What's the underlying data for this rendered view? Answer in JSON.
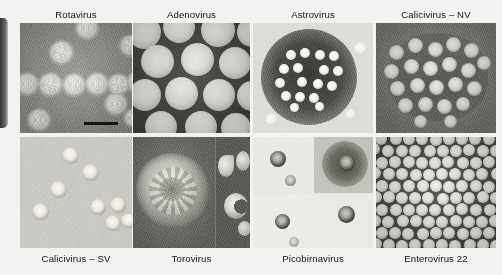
{
  "figure": {
    "kind": "electron-micrograph-panel-grid",
    "background_color": "#f2f2f0",
    "label_color": "#141414",
    "rows": 2,
    "columns": 4,
    "scale_bar": {
      "present": true,
      "panel": "Rotavirus",
      "label": ""
    },
    "edge_artifact": {
      "name": "dark-rounded-tab",
      "color": "#2c2c2c"
    }
  },
  "panels": [
    {
      "id": "rotavirus",
      "label": "Rotavirus",
      "label_position": "top",
      "row": 1,
      "col": 1,
      "stain_color": "#8e8e8a",
      "description": "wheel-like particles with spiky rim"
    },
    {
      "id": "adenovirus",
      "label": "Adenovirus",
      "label_position": "top",
      "row": 1,
      "col": 2,
      "stain_color": "#3f3f3c",
      "description": "large icosahedral particles on dark stain"
    },
    {
      "id": "astrovirus",
      "label": "Astrovirus",
      "label_position": "top",
      "row": 1,
      "col": 3,
      "stain_color": "#dddcd6",
      "description": "cluster of small particles in dark stain blob"
    },
    {
      "id": "calicivirus-nv",
      "label": "Calicivirus – NV",
      "label_position": "top",
      "row": 1,
      "col": 4,
      "stain_color": "#76756f",
      "description": "Norwalk virus particle aggregate"
    },
    {
      "id": "calicivirus-sv",
      "label": "Calicivirus – SV",
      "label_position": "bottom",
      "row": 2,
      "col": 1,
      "stain_color": "#c9c8c2",
      "description": "Sapporo virus particles with dark rims"
    },
    {
      "id": "torovirus",
      "label": "Torovirus",
      "label_position": "bottom",
      "row": 2,
      "col": 2,
      "stain_color": "#7b7a74",
      "description": "large pleomorphic enveloped particle plus inset strip"
    },
    {
      "id": "picobirnavirus",
      "label": "Picobirnavirus",
      "label_position": "bottom",
      "row": 2,
      "col": 3,
      "stain_color": "#e8e7e1",
      "description": "four sub-frames each with one small dark-rimmed particle"
    },
    {
      "id": "enterovirus-22",
      "label": "Enterovirus 22",
      "label_position": "bottom",
      "row": 2,
      "col": 4,
      "stain_color": "#46453f",
      "description": "dense close-packed array of particles"
    }
  ]
}
